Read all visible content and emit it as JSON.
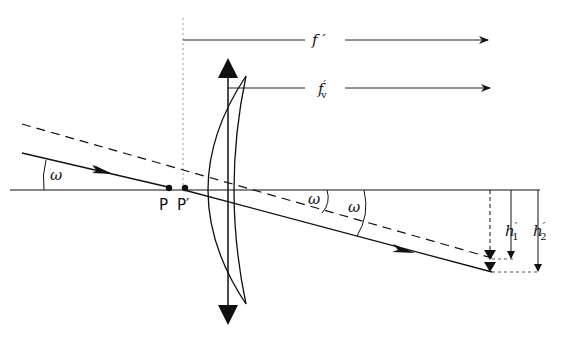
{
  "diagram": {
    "labels": {
      "focal_length": "f ′",
      "vertex_focal_length_base": "f",
      "vertex_focal_length_sub": "v",
      "vertex_focal_length_prime": "′",
      "field_angle_left": "ω",
      "field_angle_mid1": "ω",
      "field_angle_mid2": "ω",
      "principal_point": "P",
      "principal_point_prime": "P′",
      "height1_base": "h",
      "height1_prime": "′",
      "height1_sub": "1",
      "height2_base": "h",
      "height2_prime": "′",
      "height2_sub": "2"
    },
    "colors": {
      "ink": "#111111",
      "dotted": "#888888"
    }
  }
}
